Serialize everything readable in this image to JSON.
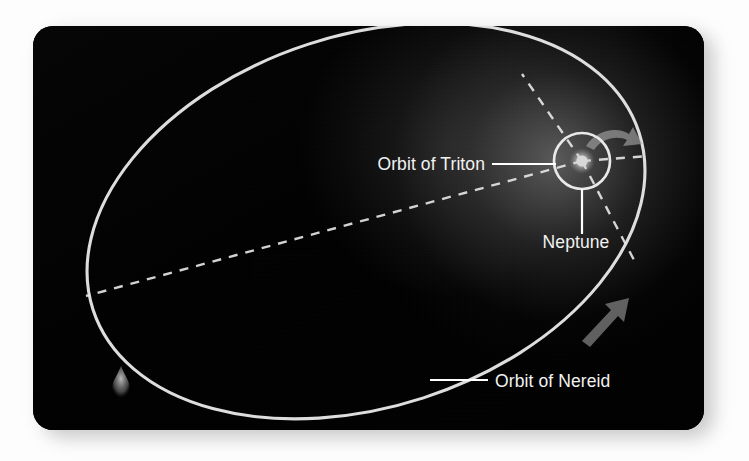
{
  "figure": {
    "kind": "astronomical-orbit-diagram",
    "panel": {
      "background_color": "#000000",
      "page_background_color": "#ffffff",
      "corner_radius_px": 20
    }
  },
  "labels": {
    "orbit_of_triton": "Orbit of Triton",
    "neptune": "Neptune",
    "orbit_of_nereid": "Orbit of Nereid"
  },
  "colors": {
    "orbit_line": "#e9e9e9",
    "dashed_line": "#e4e4e4",
    "label_text": "#f2f2f2",
    "leader_line": "#ffffff",
    "arrow_fill": "#9a9a9a",
    "neptune_body": "#cfcfcf",
    "glow": "#6e6e6e"
  },
  "geometry": {
    "nereid_orbit": {
      "shape": "ellipse",
      "center_x": 366,
      "center_y": 221,
      "radius_x": 287,
      "radius_y": 186,
      "rotation_deg": -18,
      "stroke_width": 3.1
    },
    "neptune": {
      "x": 582,
      "y": 161,
      "body_radius": 6
    },
    "triton_orbit": {
      "shape": "circle",
      "center_x": 582,
      "center_y": 161,
      "radius": 28,
      "stroke_width": 2.6
    },
    "dashed_rays": [
      {
        "name": "ray-up-left",
        "x1": 582,
        "y1": 161,
        "x2": 522,
        "y2": 74
      },
      {
        "name": "ray-right",
        "x1": 582,
        "y1": 161,
        "x2": 648,
        "y2": 156
      },
      {
        "name": "ray-down-right",
        "x1": 582,
        "y1": 161,
        "x2": 634,
        "y2": 260
      },
      {
        "name": "major-axis",
        "x1": 582,
        "y1": 161,
        "x2": 86,
        "y2": 296
      }
    ],
    "direction_arrows": [
      {
        "name": "arrow-upper",
        "description": "curved arrow indicating orbital direction near apoapsis side",
        "x": 604,
        "y": 141
      },
      {
        "name": "arrow-lower",
        "description": "arrow indicating orbital direction along lower right limb",
        "x": 604,
        "y": 318
      }
    ],
    "comet_marker": {
      "name": "teardrop-marker",
      "x": 121,
      "y": 379
    }
  },
  "leaders": {
    "triton": {
      "from_x": 492,
      "from_y": 164,
      "to_x": 556,
      "to_y": 164
    },
    "neptune": {
      "from_x": 582,
      "from_y": 189,
      "to_x": 582,
      "to_y": 238
    },
    "nereid": {
      "from_x": 430,
      "from_y": 380,
      "to_x": 487,
      "to_y": 380
    }
  }
}
